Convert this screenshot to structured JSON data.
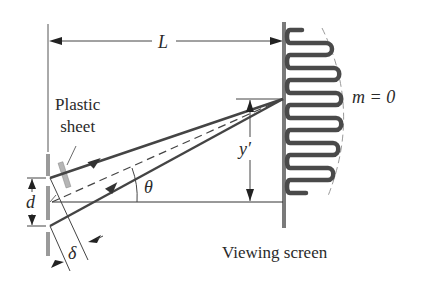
{
  "diagram": {
    "labels": {
      "distance": "L",
      "plastic_sheet_line1": "Plastic",
      "plastic_sheet_line2": "sheet",
      "central_max": "m = 0",
      "y_prime": "y′",
      "theta": "θ",
      "slit_spacing": "d",
      "path_difference": "δ",
      "viewing_screen": "Viewing screen"
    },
    "colors": {
      "line": "#3a3a3a",
      "ray": "#444444",
      "screen": "#7a7a7a",
      "slit_bar": "#9a9a9a",
      "fringe": "#4a4a4a",
      "plastic": "#b5b5b5",
      "envelope": "#9a9a9a"
    }
  }
}
